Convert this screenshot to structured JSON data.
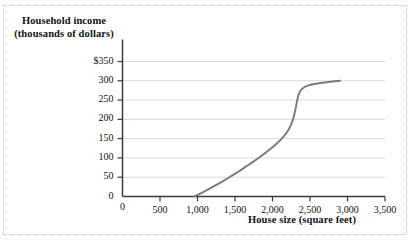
{
  "chart_data": {
    "type": "line",
    "title": "",
    "xlabel": "House size (square feet)",
    "ylabel_line1": "Household income",
    "ylabel_line2": "(thousands of dollars)",
    "xlim": [
      0,
      3500
    ],
    "ylim": [
      0,
      350
    ],
    "grid": true,
    "legend": "none",
    "x_ticks": [
      {
        "value": 0,
        "label": "0"
      },
      {
        "value": 500,
        "label": "500"
      },
      {
        "value": 1000,
        "label": "1,000"
      },
      {
        "value": 1500,
        "label": "1,500"
      },
      {
        "value": 2000,
        "label": "2,000"
      },
      {
        "value": 2500,
        "label": "2,500"
      },
      {
        "value": 3000,
        "label": "3,000"
      },
      {
        "value": 3500,
        "label": "3,500"
      }
    ],
    "y_ticks": [
      {
        "value": 0,
        "label": "0"
      },
      {
        "value": 50,
        "label": "50"
      },
      {
        "value": 100,
        "label": "100"
      },
      {
        "value": 150,
        "label": "150"
      },
      {
        "value": 200,
        "label": "200"
      },
      {
        "value": 250,
        "label": "250"
      },
      {
        "value": 300,
        "label": "300"
      },
      {
        "value": 350,
        "label": "$350"
      }
    ],
    "series": [
      {
        "name": "household income vs house size",
        "color": "#7a7a7a",
        "points": [
          {
            "x": 950,
            "y": 0
          },
          {
            "x": 1050,
            "y": 9
          },
          {
            "x": 1150,
            "y": 19
          },
          {
            "x": 1250,
            "y": 30
          },
          {
            "x": 1350,
            "y": 41
          },
          {
            "x": 1450,
            "y": 53
          },
          {
            "x": 1550,
            "y": 65
          },
          {
            "x": 1650,
            "y": 78
          },
          {
            "x": 1750,
            "y": 91
          },
          {
            "x": 1850,
            "y": 105
          },
          {
            "x": 1950,
            "y": 120
          },
          {
            "x": 2050,
            "y": 136
          },
          {
            "x": 2150,
            "y": 156
          },
          {
            "x": 2220,
            "y": 175
          },
          {
            "x": 2270,
            "y": 198
          },
          {
            "x": 2305,
            "y": 225
          },
          {
            "x": 2330,
            "y": 250
          },
          {
            "x": 2355,
            "y": 268
          },
          {
            "x": 2400,
            "y": 280
          },
          {
            "x": 2480,
            "y": 288
          },
          {
            "x": 2600,
            "y": 293
          },
          {
            "x": 2750,
            "y": 297
          },
          {
            "x": 2900,
            "y": 300
          }
        ]
      }
    ]
  }
}
